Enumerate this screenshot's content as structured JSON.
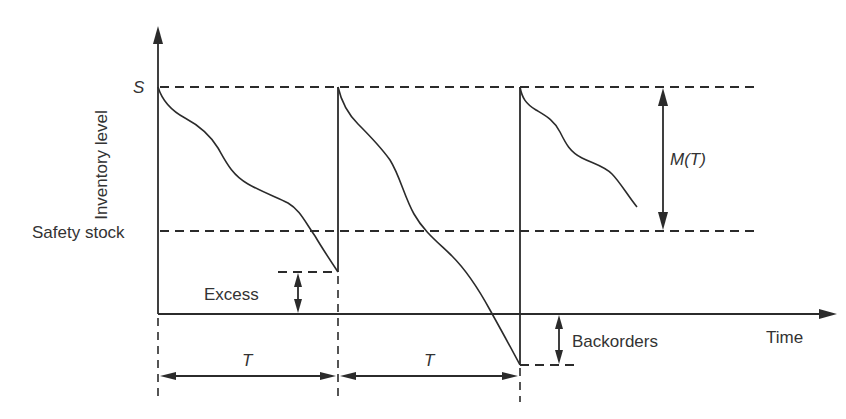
{
  "diagram": {
    "type": "periodic-review inventory level diagram",
    "y_axis_label": "Inventory level",
    "x_axis_label": "Time",
    "levels": {
      "order_up_to": "S",
      "safety_stock": "Safety stock"
    },
    "annotations": {
      "excess": "Excess",
      "backorders": "Backorders",
      "demand_over_period": "M(T)",
      "period_1": "T",
      "period_2": "T"
    },
    "colors": {
      "line": "#2b2b2b",
      "text": "#333333",
      "background": "#ffffff"
    }
  }
}
